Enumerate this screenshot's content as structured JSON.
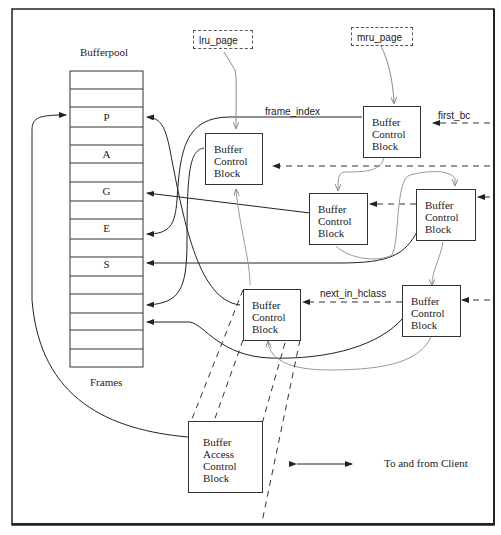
{
  "diagram": {
    "title": "Bufferpool",
    "frames_caption": "Frames",
    "frame_letters": [
      {
        "row": 3,
        "letter": "P"
      },
      {
        "row": 5,
        "letter": "A"
      },
      {
        "row": 7,
        "letter": "G"
      },
      {
        "row": 9,
        "letter": "E"
      },
      {
        "row": 11,
        "letter": "S"
      }
    ],
    "frame_count": 16,
    "pointers": {
      "lru": "lru_page",
      "mru": "mru_page"
    },
    "edge_labels": {
      "frame_index": "frame_index",
      "first_bc": "first_bc",
      "next_in_hclass": "next_in_hclass"
    },
    "bcb_blocks": [
      {
        "id": "bcb1",
        "lines": [
          "Buffer",
          "Control",
          "Block"
        ]
      },
      {
        "id": "bcb2",
        "lines": [
          "Buffer",
          "Control",
          "Block"
        ]
      },
      {
        "id": "bcb3",
        "lines": [
          "Buffer",
          "Control",
          "Block"
        ]
      },
      {
        "id": "bcb4",
        "lines": [
          "Buffer",
          "Control",
          "Block"
        ]
      },
      {
        "id": "bcb5",
        "lines": [
          "Buffer",
          "Control",
          "Block"
        ]
      },
      {
        "id": "bcb6",
        "lines": [
          "Buffer",
          "Control",
          "Block"
        ]
      }
    ],
    "bacb": {
      "lines": [
        "Buffer",
        "Access",
        "Control",
        "Block"
      ]
    },
    "legend": {
      "text": "To and from Client"
    },
    "colors": {
      "line": "#2a2a2a",
      "gray_line": "#9a9a9a",
      "border": "#222222"
    }
  }
}
